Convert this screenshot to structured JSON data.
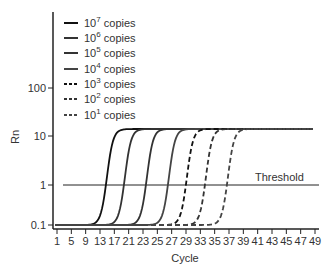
{
  "chart_data": {
    "type": "line",
    "title": "",
    "xlabel": "Cycle",
    "ylabel": "Rn",
    "yscale": "log",
    "ylim": [
      0.1,
      1000
    ],
    "x_ticks": [
      "1",
      "5",
      "9",
      "13",
      "17",
      "21",
      "23",
      "25",
      "27",
      "29",
      "33",
      "35",
      "37",
      "39",
      "41",
      "43",
      "45",
      "47",
      "49"
    ],
    "y_ticks": [
      "0.1",
      "1",
      "10",
      "100"
    ],
    "threshold": {
      "label": "Threshold",
      "value": 1
    },
    "legend_position": "upper left",
    "series": [
      {
        "name": "10^7 copies",
        "base": "10",
        "exp": "7",
        "style": "solid",
        "ct": 15.5,
        "baseline": 0.1,
        "plateau": 13
      },
      {
        "name": "10^6 copies",
        "base": "10",
        "exp": "6",
        "style": "solid",
        "ct": 20,
        "baseline": 0.1,
        "plateau": 13
      },
      {
        "name": "10^5 copies",
        "base": "10",
        "exp": "5",
        "style": "solid",
        "ct": 23.5,
        "baseline": 0.1,
        "plateau": 13
      },
      {
        "name": "10^4 copies",
        "base": "10",
        "exp": "4",
        "style": "solid",
        "ct": 27,
        "baseline": 0.1,
        "plateau": 13
      },
      {
        "name": "10^3 copies",
        "base": "10",
        "exp": "3",
        "style": "dashed",
        "ct": 29.5,
        "baseline": 0.1,
        "plateau": 13
      },
      {
        "name": "10^2 copies",
        "base": "10",
        "exp": "2",
        "style": "dashed",
        "ct": 34,
        "baseline": 0.1,
        "plateau": 13
      },
      {
        "name": "10^1 copies",
        "base": "10",
        "exp": "1",
        "style": "dashed",
        "ct": 37,
        "baseline": 0.1,
        "plateau": 13
      }
    ]
  },
  "legend": {
    "suffix": "copies",
    "items": [
      {
        "base": "10",
        "exp": "7"
      },
      {
        "base": "10",
        "exp": "6"
      },
      {
        "base": "10",
        "exp": "5"
      },
      {
        "base": "10",
        "exp": "4"
      },
      {
        "base": "10",
        "exp": "3"
      },
      {
        "base": "10",
        "exp": "2"
      },
      {
        "base": "10",
        "exp": "1"
      }
    ]
  },
  "axes": {
    "x_title": "Cycle",
    "y_title": "Rn",
    "y_ticks": [
      "100",
      "10",
      "1",
      "0.1"
    ],
    "x_ticks": [
      "1",
      "5",
      "9",
      "13",
      "17",
      "21",
      "23",
      "25",
      "27",
      "29",
      "33",
      "35",
      "37",
      "39",
      "41",
      "43",
      "45",
      "47",
      "49"
    ]
  },
  "threshold_label": "Threshold"
}
